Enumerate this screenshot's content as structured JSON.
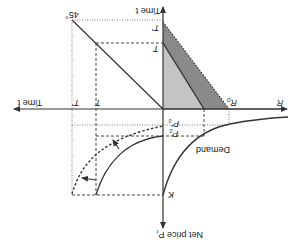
{
  "figure": {
    "orientation": "rotated-180",
    "colors": {
      "axis": "#333333",
      "line": "#333333",
      "dark_fill": "#8a8a8a",
      "light_fill": "#c4c4c4",
      "background": "#ffffff"
    }
  },
  "axes": {
    "right_label": "R",
    "up_label": "Time t",
    "left_label": "Time t",
    "down_label": "Net price P",
    "down_label_sub": "t"
  },
  "labels": {
    "angle": "45°",
    "t_prime_vertical": "T'",
    "t_vertical": "T",
    "t_prime_horizontal": "T'",
    "t_horizontal": "T",
    "r0": "R",
    "r0_sub": "0",
    "p0_prime": "P'",
    "p0_prime_sub": "0",
    "p0": "P",
    "p0_sub": "0",
    "k": "K",
    "demand": "Demand"
  }
}
